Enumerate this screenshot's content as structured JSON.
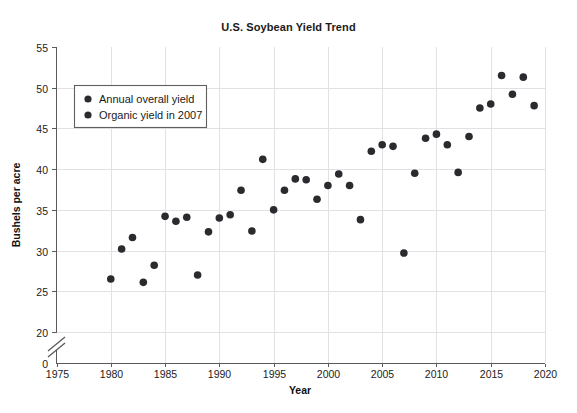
{
  "chart_data": {
    "type": "scatter",
    "title": "U.S. Soybean Yield Trend",
    "xlabel": "Year",
    "ylabel": "Bushels per acre",
    "xlim": [
      1975,
      2020
    ],
    "ylim": [
      17.5,
      55
    ],
    "xticks": [
      "1975",
      "1980",
      "1985",
      "1990",
      "1995",
      "2000",
      "2005",
      "2010",
      "2015",
      "2020"
    ],
    "xtick_values": [
      1975,
      1980,
      1985,
      1990,
      1995,
      2000,
      2005,
      2010,
      2015,
      2020
    ],
    "yticks": [
      "0",
      "20",
      "25",
      "30",
      "35",
      "40",
      "45",
      "50",
      "55"
    ],
    "ytick_values": [
      17.5,
      20,
      25,
      30,
      35,
      40,
      45,
      50,
      55
    ],
    "y_axis_break": true,
    "grid": true,
    "legend_position": "upper left",
    "marker_color": "#2b2b2f",
    "series": [
      {
        "name": "Annual overall yield",
        "marker_color": "#2b2b2f",
        "points": [
          {
            "x": 1980,
            "y": 26.5
          },
          {
            "x": 1981,
            "y": 30.2
          },
          {
            "x": 1982,
            "y": 31.6
          },
          {
            "x": 1983,
            "y": 26.1
          },
          {
            "x": 1984,
            "y": 28.2
          },
          {
            "x": 1985,
            "y": 34.2
          },
          {
            "x": 1986,
            "y": 33.6
          },
          {
            "x": 1987,
            "y": 34.1
          },
          {
            "x": 1988,
            "y": 27.0
          },
          {
            "x": 1989,
            "y": 32.3
          },
          {
            "x": 1990,
            "y": 34.0
          },
          {
            "x": 1991,
            "y": 34.4
          },
          {
            "x": 1992,
            "y": 37.4
          },
          {
            "x": 1993,
            "y": 32.4
          },
          {
            "x": 1994,
            "y": 41.2
          },
          {
            "x": 1995,
            "y": 35.0
          },
          {
            "x": 1996,
            "y": 37.4
          },
          {
            "x": 1997,
            "y": 38.8
          },
          {
            "x": 1998,
            "y": 38.7
          },
          {
            "x": 1999,
            "y": 36.3
          },
          {
            "x": 2000,
            "y": 38.0
          },
          {
            "x": 2001,
            "y": 39.4
          },
          {
            "x": 2002,
            "y": 38.0
          },
          {
            "x": 2003,
            "y": 33.8
          },
          {
            "x": 2004,
            "y": 42.2
          },
          {
            "x": 2005,
            "y": 43.0
          },
          {
            "x": 2006,
            "y": 42.8
          },
          {
            "x": 2008,
            "y": 39.5
          },
          {
            "x": 2009,
            "y": 43.8
          },
          {
            "x": 2010,
            "y": 44.3
          },
          {
            "x": 2011,
            "y": 43.0
          },
          {
            "x": 2012,
            "y": 39.6
          },
          {
            "x": 2013,
            "y": 44.0
          },
          {
            "x": 2014,
            "y": 47.5
          },
          {
            "x": 2015,
            "y": 48.0
          },
          {
            "x": 2016,
            "y": 51.5
          },
          {
            "x": 2017,
            "y": 49.2
          },
          {
            "x": 2018,
            "y": 51.3
          },
          {
            "x": 2019,
            "y": 47.8
          }
        ]
      },
      {
        "name": "Organic yield in 2007",
        "marker_color": "#2b2b2f",
        "points": [
          {
            "x": 2007,
            "y": 29.7
          }
        ]
      }
    ]
  },
  "legend": {
    "entries": [
      {
        "label": "Annual overall yield"
      },
      {
        "label": "Organic yield in 2007"
      }
    ]
  }
}
